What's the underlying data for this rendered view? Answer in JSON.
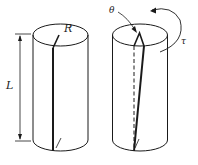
{
  "diagram": {
    "type": "torsion-illustration",
    "colors": {
      "stroke": "#1a1a1a",
      "background": "#ffffff"
    },
    "left_cylinder": {
      "state": "untwisted",
      "labels": {
        "radius": "R",
        "length": "L"
      }
    },
    "right_cylinder": {
      "state": "twisted",
      "labels": {
        "angle": "θ",
        "torque": "τ"
      }
    }
  }
}
